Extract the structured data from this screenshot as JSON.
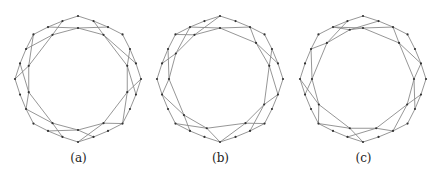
{
  "figure": {
    "panels": [
      {
        "id": "a",
        "caption": "(a)",
        "outer_count": 24,
        "inner": [
          {
            "angle": 0,
            "from": 22,
            "to": 2
          },
          {
            "angle": 30,
            "from": 1,
            "to": 5
          },
          {
            "angle": 75,
            "from": 4,
            "to": 7
          },
          {
            "angle": 105,
            "from": 6,
            "to": 9
          },
          {
            "angle": 150,
            "from": 9,
            "to": 12
          },
          {
            "angle": 180,
            "from": 11,
            "to": 14
          },
          {
            "angle": 210,
            "from": 13,
            "to": 16
          },
          {
            "angle": 255,
            "from": 16,
            "to": 19
          },
          {
            "angle": 285,
            "from": 18,
            "to": 21
          },
          {
            "angle": 330,
            "from": 20,
            "to": 23
          }
        ]
      },
      {
        "id": "b",
        "caption": "(b)",
        "outer_count": 24,
        "inner": [
          {
            "angle": 0,
            "from": 22,
            "to": 2
          },
          {
            "angle": 45,
            "from": 2,
            "to": 5
          },
          {
            "angle": 75,
            "from": 4,
            "to": 7
          },
          {
            "angle": 120,
            "from": 7,
            "to": 10
          },
          {
            "angle": 150,
            "from": 9,
            "to": 12
          },
          {
            "angle": 195,
            "from": 12,
            "to": 15
          },
          {
            "angle": 225,
            "from": 14,
            "to": 17
          },
          {
            "angle": 270,
            "from": 17,
            "to": 20
          },
          {
            "angle": 300,
            "from": 19,
            "to": 22
          },
          {
            "angle": 330,
            "from": 21,
            "to": 0
          }
        ]
      },
      {
        "id": "c",
        "caption": "(c)",
        "outer_count": 24,
        "inner": [
          {
            "angle": 0,
            "from": 22,
            "to": 2
          },
          {
            "angle": 45,
            "from": 2,
            "to": 5
          },
          {
            "angle": 90,
            "from": 5,
            "to": 8
          },
          {
            "angle": 120,
            "from": 7,
            "to": 10
          },
          {
            "angle": 165,
            "from": 10,
            "to": 13
          },
          {
            "angle": 195,
            "from": 12,
            "to": 15
          },
          {
            "angle": 240,
            "from": 15,
            "to": 18
          },
          {
            "angle": 270,
            "from": 17,
            "to": 20
          },
          {
            "angle": 315,
            "from": 20,
            "to": 23
          },
          {
            "angle": 345,
            "from": 22,
            "to": 1
          }
        ]
      }
    ]
  }
}
